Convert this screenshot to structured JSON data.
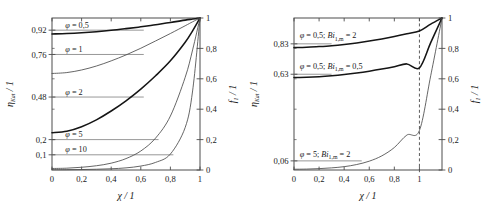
{
  "figure": {
    "panels": [
      {
        "id": "left",
        "x_axis": {
          "title": "χ / 1",
          "ticks": [
            "0",
            "0,2",
            "0,4",
            "0,6",
            "0,8",
            "1"
          ],
          "tick_values": [
            0,
            0.2,
            0.4,
            0.6,
            0.8,
            1.0
          ],
          "range": [
            0,
            1
          ]
        },
        "y_axis_left": {
          "title": "η_Kat / 1",
          "title_main": "η",
          "title_sub": "Kat",
          "title_unit": "/ 1",
          "ticks": [
            "0,92",
            "0,76",
            "0,48",
            "0,2",
            "0,1"
          ],
          "tick_values": [
            0.92,
            0.76,
            0.48,
            0.2,
            0.1
          ],
          "range": [
            0,
            1
          ]
        },
        "y_axis_right": {
          "title": "f_1 / 1",
          "title_main": "f",
          "title_sub": "1",
          "title_unit": "/ 1",
          "ticks": [
            "0",
            "0,2",
            "0,4",
            "0,6",
            "0,8",
            "1"
          ],
          "tick_values": [
            0,
            0.2,
            0.4,
            0.6,
            0.8,
            1.0
          ],
          "range": [
            0,
            1
          ]
        },
        "annotations": [
          {
            "text": "φ = 0,5",
            "phi": "0,5",
            "x": 0.09,
            "y": 0.955
          },
          {
            "text": "φ = 1",
            "phi": "1",
            "x": 0.09,
            "y": 0.795
          },
          {
            "text": "φ = 2",
            "phi": "2",
            "x": 0.09,
            "y": 0.515
          },
          {
            "text": "φ = 5",
            "phi": "5",
            "x": 0.09,
            "y": 0.235
          },
          {
            "text": "φ = 10",
            "phi": "10",
            "x": 0.09,
            "y": 0.135
          }
        ],
        "guide_lines": [
          {
            "y": 0.92,
            "x_end": 0.62,
            "weight": "thin"
          },
          {
            "y": 0.76,
            "x_end": 0.62,
            "weight": "thin"
          },
          {
            "y": 0.48,
            "x_end": 0.62,
            "weight": "thin"
          },
          {
            "y": 0.2,
            "x_end": 0.72,
            "weight": "thin"
          },
          {
            "y": 0.1,
            "x_end": 0.82,
            "weight": "thin"
          }
        ]
      },
      {
        "id": "right",
        "x_axis": {
          "title": "χ / 1",
          "ticks": [
            "0",
            "0,2",
            "0,4",
            "0,6",
            "0,8",
            "1"
          ],
          "tick_values": [
            0,
            0.2,
            0.4,
            0.6,
            0.8,
            1.0
          ],
          "range": [
            0,
            1.18
          ]
        },
        "y_axis_left": {
          "title": "η_Kat / 1",
          "title_main": "η",
          "title_sub": "Kat",
          "title_unit": "/ 1",
          "ticks": [
            "0,83",
            "0,63",
            "0,06"
          ],
          "tick_values": [
            0.83,
            0.63,
            0.06
          ],
          "range": [
            0,
            1
          ]
        },
        "y_axis_right": {
          "title": "f_1 / 1",
          "title_main": "f",
          "title_sub": "1",
          "title_unit": "/ 1",
          "ticks": [
            "0",
            "0,2",
            "0,4",
            "0,6",
            "0,8",
            "1"
          ],
          "tick_values": [
            0,
            0.2,
            0.4,
            0.6,
            0.8,
            1.0
          ],
          "range": [
            0,
            1
          ]
        },
        "annotations": [
          {
            "text": "φ = 0,5;  Bi₁,ₘ = 2",
            "phi": "0,5",
            "bi": "2",
            "x": 0.045,
            "y": 0.885
          },
          {
            "text": "φ = 0,5;  Bi₁,ₘ = 0,5",
            "phi": "0,5",
            "bi": "0,5",
            "x": 0.045,
            "y": 0.685
          },
          {
            "text": "φ = 5;  Bi₁,ₘ = 2",
            "phi": "5",
            "bi": "2",
            "x": 0.045,
            "y": 0.105
          }
        ],
        "guide_lines": [
          {
            "y": 0.83,
            "x_end": 0.3,
            "weight": "thin"
          },
          {
            "y": 0.63,
            "x_end": 0.3,
            "weight": "thin"
          },
          {
            "y": 0.06,
            "x_end": 0.54,
            "weight": "thin"
          }
        ],
        "dashed_line_x": 1.0
      }
    ],
    "colors": {
      "axis": "#4d4d4d",
      "curve_dark": "#151515",
      "curve_mid": "#4a4a4a",
      "curve_light": "#6f6f6f",
      "guide": "#8c8c8c",
      "text": "#1a1a1a",
      "background": "#ffffff"
    }
  },
  "chart_data": {
    "type": "line",
    "title": "",
    "panels": [
      {
        "name": "left-panel",
        "xlabel": "χ / 1",
        "ylabel_left": "η_Kat / 1",
        "ylabel_right": "f_1 / 1",
        "xlim": [
          0,
          1
        ],
        "ylim": [
          0,
          1
        ],
        "grid": false,
        "legend": "inline-annotations",
        "x": [
          0,
          0.1,
          0.2,
          0.3,
          0.4,
          0.5,
          0.6,
          0.7,
          0.8,
          0.9,
          0.95,
          1.0
        ],
        "series": [
          {
            "name": "φ = 0,5",
            "eta_kat": 0.92,
            "weight": "thick",
            "values": [
              0.895,
              0.898,
              0.903,
              0.91,
              0.919,
              0.93,
              0.942,
              0.956,
              0.97,
              0.986,
              0.993,
              1.0
            ]
          },
          {
            "name": "φ = 1",
            "eta_kat": 0.76,
            "weight": "thin",
            "values": [
              0.635,
              0.641,
              0.658,
              0.684,
              0.718,
              0.757,
              0.801,
              0.849,
              0.898,
              0.949,
              0.975,
              1.0
            ]
          },
          {
            "name": "φ = 2",
            "eta_kat": 0.48,
            "weight": "thick",
            "values": [
              0.245,
              0.255,
              0.285,
              0.33,
              0.388,
              0.455,
              0.532,
              0.62,
              0.718,
              0.84,
              0.915,
              1.0
            ]
          },
          {
            "name": "φ = 5",
            "eta_kat": 0.2,
            "weight": "thin",
            "values": [
              0.01,
              0.012,
              0.018,
              0.028,
              0.045,
              0.075,
              0.125,
              0.21,
              0.355,
              0.61,
              0.79,
              1.0
            ]
          },
          {
            "name": "φ = 10",
            "eta_kat": 0.1,
            "weight": "thin",
            "values": [
              0.002,
              0.002,
              0.003,
              0.005,
              0.008,
              0.014,
              0.026,
              0.05,
              0.105,
              0.28,
              0.52,
              1.0
            ]
          }
        ]
      },
      {
        "name": "right-panel",
        "xlabel": "χ / 1",
        "ylabel_left": "η_Kat / 1",
        "ylabel_right": "f_1 / 1",
        "xlim": [
          0,
          1.18
        ],
        "ylim": [
          0,
          1
        ],
        "grid": false,
        "legend": "inline-annotations",
        "dashed_marker_x": 1.0,
        "x": [
          0,
          0.1,
          0.2,
          0.3,
          0.4,
          0.5,
          0.6,
          0.7,
          0.8,
          0.9,
          1.0,
          1.09,
          1.18
        ],
        "series": [
          {
            "name": "φ = 0,5; Bi_1,m = 2",
            "eta_kat": 0.83,
            "weight": "thick",
            "values": [
              0.805,
              0.807,
              0.812,
              0.818,
              0.826,
              0.836,
              0.848,
              0.862,
              0.878,
              0.896,
              0.915,
              0.96,
              1.0
            ]
          },
          {
            "name": "φ = 0,5; Bi_1,m = 0,5",
            "eta_kat": 0.63,
            "weight": "thick",
            "values": [
              0.608,
              0.61,
              0.614,
              0.62,
              0.628,
              0.638,
              0.65,
              0.664,
              0.68,
              0.698,
              0.672,
              0.838,
              1.0
            ]
          },
          {
            "name": "φ = 5; Bi_1,m = 2",
            "eta_kat": 0.06,
            "weight": "thin",
            "values": [
              0.005,
              0.006,
              0.009,
              0.014,
              0.022,
              0.036,
              0.058,
              0.093,
              0.148,
              0.23,
              0.26,
              0.62,
              1.0
            ]
          }
        ]
      }
    ]
  }
}
